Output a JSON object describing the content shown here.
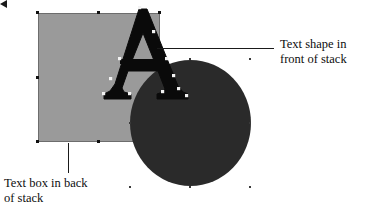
{
  "figure": {
    "type": "shape-stacking-illustration",
    "background_color": "#ffffff"
  },
  "shapes": [
    {
      "id": "text-box",
      "name": "Text box",
      "kind": "rectangle",
      "fill": "#9a9a9a",
      "stroke": "#6d6d6d",
      "z_order": "back",
      "selected": true
    },
    {
      "id": "ellipse",
      "name": "Ellipse",
      "kind": "circle",
      "fill": "#2a2a2a",
      "stroke": "none",
      "z_order": "middle",
      "selected": true
    },
    {
      "id": "text-shape",
      "name": "Text shape",
      "kind": "letterform",
      "glyph": "A",
      "fill": "#0a0a0a",
      "z_order": "front",
      "selected": true
    }
  ],
  "callouts": {
    "front": {
      "line_1": "Text shape in",
      "line_2": "front of stack",
      "leader": "arrow-left",
      "points_to": "text-shape"
    },
    "back": {
      "line_1": "Text box in back",
      "line_2": "of stack",
      "leader": "vertical-line",
      "points_to": "text-box"
    }
  },
  "colors": {
    "rectangle_fill": "#9a9a9a",
    "rectangle_stroke": "#6d6d6d",
    "circle_fill": "#2a2a2a",
    "letter_fill": "#0a0a0a",
    "handle_dark": "#111111",
    "handle_light": "#f2f2f2",
    "leader_line": "#1a1a1a",
    "label_text": "#0d0d0d"
  }
}
